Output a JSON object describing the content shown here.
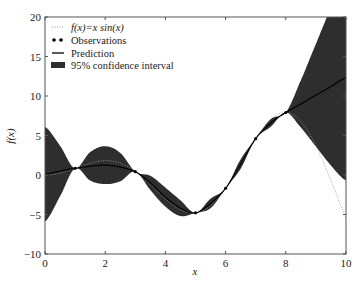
{
  "chart_data": {
    "type": "line",
    "title": "",
    "xlabel": "x",
    "ylabel": "f(x)",
    "xlim": [
      0,
      10
    ],
    "ylim": [
      -10,
      20
    ],
    "xticks": [
      0,
      2,
      4,
      6,
      8,
      10
    ],
    "yticks": [
      -10,
      -5,
      0,
      5,
      10,
      15,
      20
    ],
    "grid": false,
    "legend_position": "upper left",
    "legend": [
      "f(x)=x sin(x)",
      "Observations",
      "Prediction",
      "95% confidence interval"
    ],
    "observations": {
      "x": [
        1,
        3,
        5,
        6,
        7,
        8
      ],
      "y": [
        0.84,
        0.42,
        -4.79,
        -1.68,
        4.6,
        7.91
      ]
    },
    "prediction": {
      "x": [
        0,
        0.5,
        1,
        1.5,
        2,
        2.5,
        3,
        3.5,
        4,
        4.5,
        5,
        5.5,
        6,
        6.5,
        7,
        7.5,
        8,
        8.5,
        9,
        9.5,
        10
      ],
      "y": [
        0.1,
        0.5,
        0.84,
        1.1,
        1.25,
        1.0,
        0.42,
        -1.0,
        -2.8,
        -4.2,
        -4.79,
        -3.6,
        -1.68,
        1.4,
        4.6,
        6.6,
        7.91,
        9.0,
        10.1,
        11.2,
        12.3
      ]
    },
    "confidence_interval_halfwidth": [
      6.0,
      3.2,
      0.0,
      1.8,
      2.4,
      1.8,
      0.0,
      0.9,
      1.2,
      1.0,
      0.0,
      0.6,
      0.0,
      0.6,
      0.0,
      0.5,
      0.0,
      3.0,
      6.5,
      10.0,
      13.0
    ]
  },
  "legend": {
    "true_function": "f(x)=x sin(x)",
    "observations": "Observations",
    "prediction": "Prediction",
    "ci": "95% confidence interval"
  },
  "axes": {
    "xlabel": "x",
    "ylabel": "f(x)",
    "xtick_labels": [
      "0",
      "2",
      "4",
      "6",
      "8",
      "10"
    ],
    "ytick_labels": [
      "−10",
      "−5",
      "0",
      "5",
      "10",
      "15",
      "20"
    ]
  },
  "colors": {
    "band": "#2e2e2e",
    "prediction": "#000000",
    "true_function": "#999999",
    "axes": "#555555"
  }
}
